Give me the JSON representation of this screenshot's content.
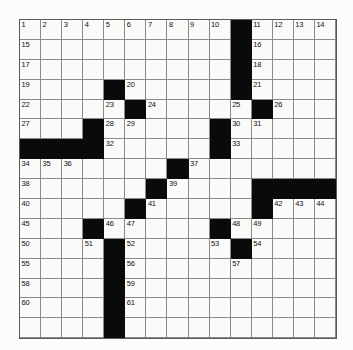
{
  "puzzle": {
    "type": "crossword-grid",
    "rows": 16,
    "cols": 15,
    "colors": {
      "block": "#0a0a0a",
      "cell": "#fafaf8",
      "grid_line": "#8a8a8a",
      "number_text": "#111111",
      "page_background": "#fcfcfb"
    },
    "blocks": [
      [
        0,
        10
      ],
      [
        1,
        10
      ],
      [
        2,
        10
      ],
      [
        3,
        4
      ],
      [
        3,
        10
      ],
      [
        4,
        5
      ],
      [
        4,
        11
      ],
      [
        5,
        3
      ],
      [
        5,
        9
      ],
      [
        6,
        0
      ],
      [
        6,
        1
      ],
      [
        6,
        2
      ],
      [
        6,
        3
      ],
      [
        6,
        9
      ],
      [
        7,
        7
      ],
      [
        8,
        6
      ],
      [
        8,
        11
      ],
      [
        8,
        12
      ],
      [
        8,
        13
      ],
      [
        8,
        14
      ],
      [
        9,
        5
      ],
      [
        9,
        11
      ],
      [
        10,
        3
      ],
      [
        10,
        9
      ],
      [
        11,
        4
      ],
      [
        11,
        10
      ],
      [
        12,
        4
      ],
      [
        13,
        4
      ],
      [
        14,
        4
      ],
      [
        15,
        4
      ]
    ],
    "numbers": [
      {
        "row": 0,
        "col": 0,
        "n": "1"
      },
      {
        "row": 0,
        "col": 1,
        "n": "2"
      },
      {
        "row": 0,
        "col": 2,
        "n": "3"
      },
      {
        "row": 0,
        "col": 3,
        "n": "4"
      },
      {
        "row": 0,
        "col": 4,
        "n": "5"
      },
      {
        "row": 0,
        "col": 5,
        "n": "6"
      },
      {
        "row": 0,
        "col": 6,
        "n": "7"
      },
      {
        "row": 0,
        "col": 7,
        "n": "8"
      },
      {
        "row": 0,
        "col": 8,
        "n": "9"
      },
      {
        "row": 0,
        "col": 9,
        "n": "10"
      },
      {
        "row": 0,
        "col": 11,
        "n": "11"
      },
      {
        "row": 0,
        "col": 12,
        "n": "12"
      },
      {
        "row": 0,
        "col": 13,
        "n": "13"
      },
      {
        "row": 0,
        "col": 14,
        "n": "14"
      },
      {
        "row": 1,
        "col": 0,
        "n": "15"
      },
      {
        "row": 1,
        "col": 11,
        "n": "16"
      },
      {
        "row": 2,
        "col": 0,
        "n": "17"
      },
      {
        "row": 2,
        "col": 11,
        "n": "18"
      },
      {
        "row": 3,
        "col": 0,
        "n": "19"
      },
      {
        "row": 3,
        "col": 5,
        "n": "20"
      },
      {
        "row": 3,
        "col": 11,
        "n": "21"
      },
      {
        "row": 4,
        "col": 0,
        "n": "22"
      },
      {
        "row": 4,
        "col": 4,
        "n": "23"
      },
      {
        "row": 4,
        "col": 6,
        "n": "24"
      },
      {
        "row": 4,
        "col": 10,
        "n": "25"
      },
      {
        "row": 4,
        "col": 12,
        "n": "26"
      },
      {
        "row": 5,
        "col": 0,
        "n": "27"
      },
      {
        "row": 5,
        "col": 4,
        "n": "28"
      },
      {
        "row": 5,
        "col": 5,
        "n": "29"
      },
      {
        "row": 5,
        "col": 10,
        "n": "30"
      },
      {
        "row": 5,
        "col": 11,
        "n": "31"
      },
      {
        "row": 6,
        "col": 4,
        "n": "32"
      },
      {
        "row": 6,
        "col": 10,
        "n": "33"
      },
      {
        "row": 7,
        "col": 0,
        "n": "34"
      },
      {
        "row": 7,
        "col": 1,
        "n": "35"
      },
      {
        "row": 7,
        "col": 2,
        "n": "36"
      },
      {
        "row": 7,
        "col": 8,
        "n": "37"
      },
      {
        "row": 8,
        "col": 0,
        "n": "38"
      },
      {
        "row": 8,
        "col": 7,
        "n": "39"
      },
      {
        "row": 9,
        "col": 0,
        "n": "40"
      },
      {
        "row": 9,
        "col": 6,
        "n": "41"
      },
      {
        "row": 9,
        "col": 12,
        "n": "42"
      },
      {
        "row": 9,
        "col": 13,
        "n": "43"
      },
      {
        "row": 9,
        "col": 14,
        "n": "44"
      },
      {
        "row": 10,
        "col": 0,
        "n": "45"
      },
      {
        "row": 10,
        "col": 4,
        "n": "46"
      },
      {
        "row": 10,
        "col": 5,
        "n": "47"
      },
      {
        "row": 10,
        "col": 10,
        "n": "48"
      },
      {
        "row": 10,
        "col": 11,
        "n": "49"
      },
      {
        "row": 11,
        "col": 0,
        "n": "50"
      },
      {
        "row": 11,
        "col": 3,
        "n": "51"
      },
      {
        "row": 11,
        "col": 5,
        "n": "52"
      },
      {
        "row": 11,
        "col": 9,
        "n": "53"
      },
      {
        "row": 11,
        "col": 11,
        "n": "54"
      },
      {
        "row": 12,
        "col": 0,
        "n": "55"
      },
      {
        "row": 12,
        "col": 5,
        "n": "56"
      },
      {
        "row": 12,
        "col": 10,
        "n": "57"
      },
      {
        "row": 13,
        "col": 0,
        "n": "58"
      },
      {
        "row": 13,
        "col": 5,
        "n": "59"
      },
      {
        "row": 14,
        "col": 0,
        "n": "60"
      },
      {
        "row": 14,
        "col": 5,
        "n": "61"
      }
    ]
  }
}
